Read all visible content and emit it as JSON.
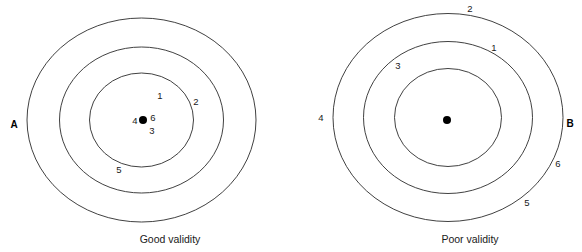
{
  "figure": {
    "width": 582,
    "height": 252,
    "background_color": "#ffffff",
    "line_color": "#2b2b2b",
    "text_color": "#1a1a1a"
  },
  "chart_data": {
    "type": "scatter",
    "title": "",
    "xlabel": "",
    "ylabel": "",
    "panels": [
      {
        "letter": "A",
        "caption": "Good validity",
        "center": {
          "x": 141.5,
          "y": 120
        },
        "rings": [
          {
            "rx": 114.5,
            "ry": 102
          },
          {
            "rx": 82,
            "ry": 73
          },
          {
            "rx": 52,
            "ry": 47
          }
        ],
        "bullseye": {
          "x": 143,
          "y": 120,
          "r": 4
        },
        "shots": [
          {
            "label": "1",
            "x": 160,
            "y": 96
          },
          {
            "label": "2",
            "x": 196,
            "y": 102
          },
          {
            "label": "3",
            "x": 152,
            "y": 131
          },
          {
            "label": "4",
            "x": 135,
            "y": 121
          },
          {
            "label": "5",
            "x": 119,
            "y": 170
          },
          {
            "label": "6",
            "x": 153,
            "y": 118
          }
        ]
      },
      {
        "letter": "B",
        "caption": "Poor validity",
        "center": {
          "x": 448,
          "y": 117.5
        },
        "rings": [
          {
            "rx": 115,
            "ry": 104
          },
          {
            "rx": 84.5,
            "ry": 76
          },
          {
            "rx": 53.5,
            "ry": 49
          }
        ],
        "bullseye": {
          "x": 447,
          "y": 120,
          "r": 4
        },
        "shots": [
          {
            "label": "1",
            "x": 494,
            "y": 48
          },
          {
            "label": "2",
            "x": 470,
            "y": 9
          },
          {
            "label": "3",
            "x": 398,
            "y": 66
          },
          {
            "label": "4",
            "x": 321,
            "y": 118
          },
          {
            "label": "5",
            "x": 527,
            "y": 203
          },
          {
            "label": "6",
            "x": 558,
            "y": 164
          }
        ]
      }
    ],
    "panel_letter_positions": [
      {
        "label": "A",
        "x": 14,
        "y": 125
      },
      {
        "label": "B",
        "x": 570,
        "y": 124
      }
    ],
    "caption_positions": [
      {
        "label": "Good validity",
        "x": 170,
        "y": 240
      },
      {
        "label": "Poor validity",
        "x": 470,
        "y": 240
      }
    ]
  }
}
